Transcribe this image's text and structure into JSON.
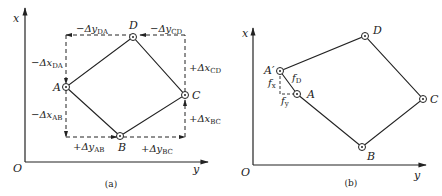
{
  "figure_a": {
    "caption": "(a)",
    "axes": {
      "x": "x",
      "y": "y",
      "origin": "O"
    },
    "points": {
      "A": "A",
      "B": "B",
      "C": "C",
      "D": "D"
    },
    "increments": {
      "dy_DA": {
        "sign": "−Δ",
        "var": "y",
        "sub": "DA"
      },
      "dy_CD": {
        "sign": "−Δ",
        "var": "y",
        "sub": "CD"
      },
      "dx_DA": {
        "sign": "−Δ",
        "var": "x",
        "sub": "DA"
      },
      "dx_AB": {
        "sign": "−Δ",
        "var": "x",
        "sub": "AB"
      },
      "dx_CD": {
        "sign": "+Δ",
        "var": "x",
        "sub": "CD"
      },
      "dx_BC": {
        "sign": "+Δ",
        "var": "x",
        "sub": "BC"
      },
      "dy_AB": {
        "sign": "+Δ",
        "var": "y",
        "sub": "AB"
      },
      "dy_BC": {
        "sign": "+Δ",
        "var": "y",
        "sub": "BC"
      }
    }
  },
  "figure_b": {
    "caption": "(b)",
    "axes": {
      "x": "x",
      "y": "y",
      "origin": "O"
    },
    "points": {
      "A": "A",
      "A_prime": "A′",
      "B": "B",
      "C": "C",
      "D": "D"
    },
    "errors": {
      "fD": {
        "var": "f",
        "sub": "D"
      },
      "fx": {
        "var": "f",
        "sub": "x"
      },
      "fy": {
        "var": "f",
        "sub": "y"
      }
    }
  }
}
